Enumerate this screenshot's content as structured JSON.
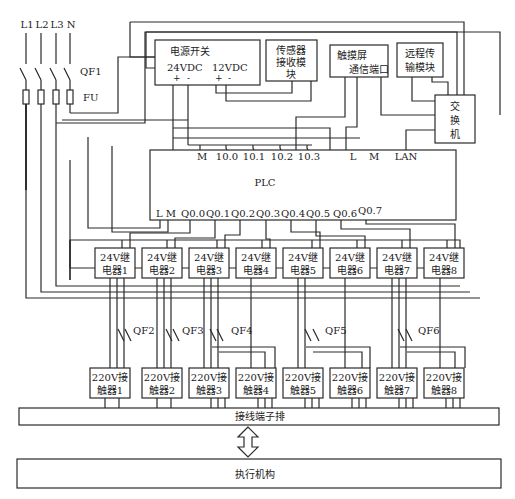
{
  "supply": {
    "lines": [
      "L1",
      "L2",
      "L3",
      "N"
    ],
    "main_breaker": "QF1",
    "fuse": "FU"
  },
  "power_switch": {
    "title": "电源开关",
    "out24": "24VDC",
    "out12": "12VDC",
    "plus": "+",
    "minus": "-"
  },
  "sensor_module": {
    "line1": "传感器",
    "line2": "接收模块",
    "line3": "块"
  },
  "touchscreen": {
    "line1": "触摸屏",
    "line2": "通信端口"
  },
  "remote_module": {
    "line1": "远程传",
    "line2": "输模块"
  },
  "switch": {
    "line1": "交",
    "line2": "换",
    "line3": "机"
  },
  "plc": {
    "label": "PLC",
    "top_terminals": [
      "M",
      "10.0",
      "10.1",
      "10.2",
      "10.3",
      "L",
      "M",
      "LAN"
    ],
    "bottom_terminals": [
      "L M",
      "Q0.0",
      "Q0.1",
      "Q0.2",
      "Q0.3",
      "Q0.4",
      "Q0.5",
      "Q0.6",
      "Q0.7"
    ]
  },
  "relays": [
    {
      "line1": "24V继",
      "line2": "电器1"
    },
    {
      "line1": "24V继",
      "line2": "电器2"
    },
    {
      "line1": "24V继",
      "line2": "电器3"
    },
    {
      "line1": "24V继",
      "line2": "电器4"
    },
    {
      "line1": "24V继",
      "line2": "电器5"
    },
    {
      "line1": "24V继",
      "line2": "电器6"
    },
    {
      "line1": "24V继",
      "line2": "电器7"
    },
    {
      "line1": "24V继",
      "line2": "电器8"
    }
  ],
  "breakers": [
    "QF2",
    "QF3",
    "QF4",
    "QF5",
    "QF6"
  ],
  "contactors": [
    {
      "line1": "220V接",
      "line2": "触器1"
    },
    {
      "line1": "220V接",
      "line2": "触器2"
    },
    {
      "line1": "220V接",
      "line2": "触器3"
    },
    {
      "line1": "220V接",
      "line2": "触器4"
    },
    {
      "line1": "220V接",
      "line2": "触器5"
    },
    {
      "line1": "220V接",
      "line2": "触器6"
    },
    {
      "line1": "220V接",
      "line2": "触器7"
    },
    {
      "line1": "220V接",
      "line2": "触器8"
    }
  ],
  "terminal_block": "接线端子排",
  "actuator": "执行机构"
}
